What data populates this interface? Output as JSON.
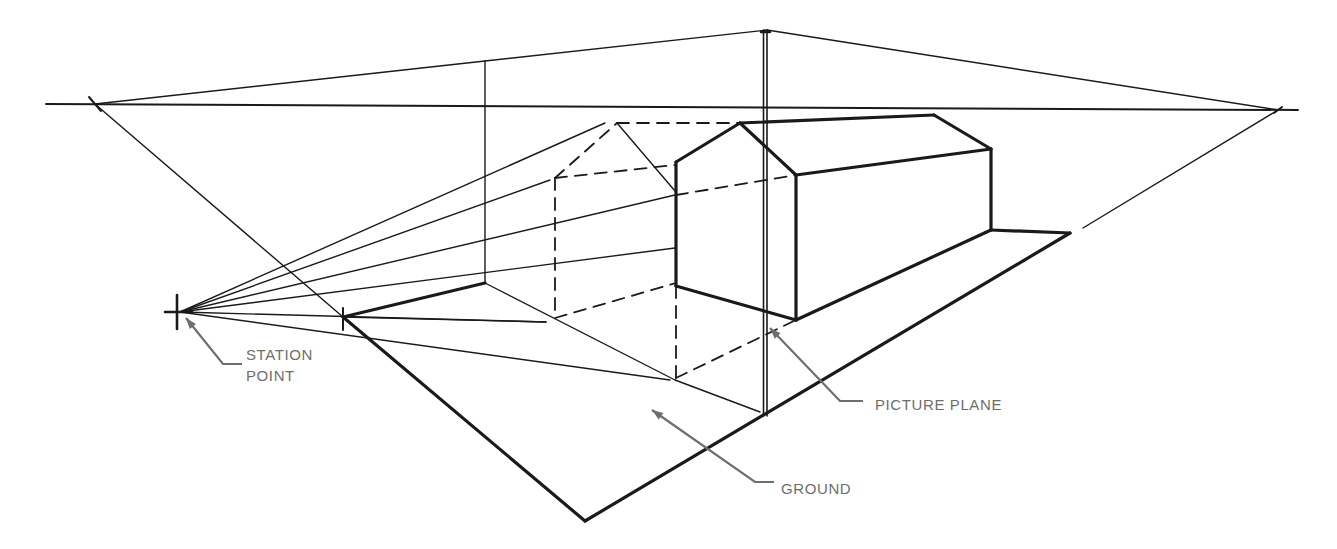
{
  "colors": {
    "ink": "#1a1a1a",
    "label": "#6e6e6e",
    "background": "#ffffff"
  },
  "labels": [
    {
      "id": "station-point",
      "lines": [
        "STATION",
        "POINT"
      ],
      "x": 246,
      "y": 344
    },
    {
      "id": "picture-plane",
      "lines": [
        "PICTURE PLANE"
      ],
      "x": 875,
      "y": 394
    },
    {
      "id": "ground",
      "lines": [
        "GROUND"
      ],
      "x": 781,
      "y": 478
    }
  ],
  "geometry": {
    "horizon": [
      [
        46,
        104
      ],
      [
        1298,
        110
      ]
    ],
    "vanishing_points": {
      "left": [
        95,
        104
      ],
      "right": [
        1278,
        110
      ]
    },
    "station_point": [
      180,
      312
    ],
    "picture_plane_top": [
      767,
      30
    ],
    "ground_plane": [
      [
        343,
        317
      ],
      [
        585,
        521
      ],
      [
        1070,
        233
      ]
    ],
    "thick_lines": [
      [
        [
          343,
          317
        ],
        [
          585,
          521
        ]
      ],
      [
        [
          585,
          521
        ],
        [
          1070,
          233
        ]
      ],
      [
        [
          343,
          317
        ],
        [
          485,
          283
        ]
      ],
      [
        [
          740,
          123
        ],
        [
          934,
          115
        ]
      ],
      [
        [
          934,
          115
        ],
        [
          991,
          149
        ]
      ],
      [
        [
          991,
          149
        ],
        [
          991,
          230
        ]
      ],
      [
        [
          991,
          230
        ],
        [
          796,
          320
        ]
      ],
      [
        [
          796,
          320
        ],
        [
          676,
          286
        ]
      ],
      [
        [
          676,
          286
        ],
        [
          676,
          162
        ]
      ],
      [
        [
          676,
          162
        ],
        [
          740,
          123
        ]
      ],
      [
        [
          740,
          123
        ],
        [
          796,
          175
        ]
      ],
      [
        [
          796,
          175
        ],
        [
          796,
          320
        ]
      ],
      [
        [
          796,
          175
        ],
        [
          991,
          149
        ]
      ],
      [
        [
          991,
          230
        ],
        [
          1070,
          233
        ]
      ]
    ],
    "thin_lines": [
      [
        [
          95,
          104
        ],
        [
          485,
          61
        ]
      ],
      [
        [
          485,
          61
        ],
        [
          767,
          30
        ]
      ],
      [
        [
          767,
          30
        ],
        [
          1278,
          110
        ]
      ],
      [
        [
          95,
          104
        ],
        [
          343,
          317
        ]
      ],
      [
        [
          1278,
          110
        ],
        [
          1083,
          228
        ]
      ],
      [
        [
          485,
          61
        ],
        [
          485,
          283
        ]
      ],
      [
        [
          180,
          312
        ],
        [
          605,
          123
        ]
      ],
      [
        [
          180,
          312
        ],
        [
          550,
          180
        ]
      ],
      [
        [
          180,
          312
        ],
        [
          675,
          195
        ]
      ],
      [
        [
          180,
          312
        ],
        [
          675,
          248
        ]
      ],
      [
        [
          180,
          312
        ],
        [
          546,
          322
        ]
      ],
      [
        [
          180,
          312
        ],
        [
          670,
          380
        ]
      ],
      [
        [
          485,
          283
        ],
        [
          675,
          380
        ]
      ],
      [
        [
          675,
          380
        ],
        [
          760,
          412
        ]
      ],
      [
        [
          617,
          123
        ],
        [
          675,
          191
        ]
      ],
      [
        [
          343,
          317
        ],
        [
          546,
          322
        ]
      ]
    ],
    "dashed_lines": [
      [
        [
          617,
          123
        ],
        [
          740,
          123
        ]
      ],
      [
        [
          555,
          178
        ],
        [
          617,
          123
        ]
      ],
      [
        [
          555,
          178
        ],
        [
          555,
          318
        ]
      ],
      [
        [
          555,
          178
        ],
        [
          675,
          165
        ]
      ],
      [
        [
          676,
          195
        ],
        [
          796,
          175
        ]
      ],
      [
        [
          555,
          318
        ],
        [
          676,
          283
        ]
      ],
      [
        [
          676,
          286
        ],
        [
          676,
          378
        ]
      ],
      [
        [
          676,
          378
        ],
        [
          796,
          320
        ]
      ]
    ],
    "picture_plane_double": {
      "x": 765,
      "y1": 30,
      "y2": 416
    },
    "leaders": [
      {
        "id": "station-point-leader",
        "points": [
          [
            186,
            318
          ],
          [
            223,
            364
          ],
          [
            242,
            364
          ]
        ]
      },
      {
        "id": "picture-plane-leader",
        "points": [
          [
            770,
            328
          ],
          [
            840,
            401
          ],
          [
            863,
            401
          ]
        ]
      },
      {
        "id": "ground-leader",
        "points": [
          [
            652,
            410
          ],
          [
            755,
            482
          ],
          [
            774,
            482
          ]
        ]
      }
    ]
  }
}
